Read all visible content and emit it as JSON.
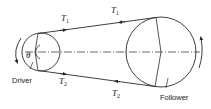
{
  "diagram": {
    "type": "belt-drive",
    "colors": {
      "stroke": "#2a2a2a",
      "background": "#ffffff"
    },
    "driver": {
      "label": "Driver",
      "angle_symbol": "θ",
      "rotation": "counter-clockwise"
    },
    "follower": {
      "label": "Follower",
      "rotation": "counter-clockwise"
    },
    "belt": {
      "tight_side": {
        "label": "T",
        "subscript": "1"
      },
      "slack_side": {
        "label": "T",
        "subscript": "2"
      }
    }
  }
}
